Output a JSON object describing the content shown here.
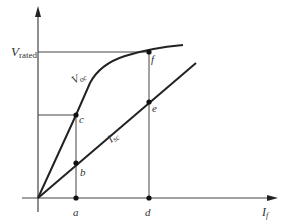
{
  "diagram": {
    "type": "generator characteristic (OCC / SCC)",
    "axes": {
      "y_label_main": "V",
      "y_label_sub": "rated",
      "x_label_main": "I",
      "x_label_sub": "f"
    },
    "curves": [
      {
        "name": "open-circuit-characteristic",
        "label_main": "V",
        "label_sub": "oc"
      },
      {
        "name": "short-circuit-characteristic",
        "label_main": "I",
        "label_sub": "sc"
      }
    ],
    "points": {
      "a": "a",
      "b": "b",
      "c": "c",
      "d": "d",
      "e": "e",
      "f": "f"
    },
    "colors": {
      "ink": "#222222",
      "thin": "#444444",
      "background": "#ffffff"
    }
  }
}
